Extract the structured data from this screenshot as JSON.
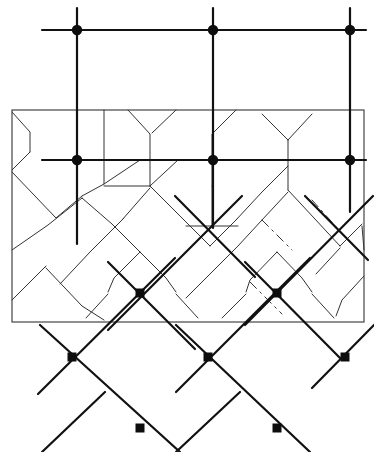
{
  "figure": {
    "background_color": "#ffffff",
    "ink_color": "#111111",
    "canvas": {
      "width": 374,
      "height": 452
    }
  },
  "frame": {
    "name": "rectangular-window",
    "x": 12,
    "y": 110,
    "width": 352,
    "height": 212,
    "stroke": "#333333",
    "stroke_width": 1.1
  },
  "orthogonal_lattice": {
    "stroke": "#111111",
    "stroke_width": 2.2,
    "marker_shape": "circle",
    "marker_radius": 5.2,
    "marker_fill": "#0d0d0d",
    "horizontal_lines": [
      {
        "y": 30,
        "x1": 42,
        "x2": 366
      },
      {
        "y": 160,
        "x1": 42,
        "x2": 366
      }
    ],
    "vertical_lines": [
      {
        "x": 77,
        "y1": 8,
        "y2": 244
      },
      {
        "x": 213,
        "y1": 8,
        "y2": 228
      },
      {
        "x": 350,
        "y1": 8,
        "y2": 212
      }
    ],
    "nodes": [
      {
        "cx": 77,
        "cy": 30
      },
      {
        "cx": 213,
        "cy": 30
      },
      {
        "cx": 350,
        "cy": 30
      },
      {
        "cx": 77,
        "cy": 160
      },
      {
        "cx": 213,
        "cy": 160
      },
      {
        "cx": 350,
        "cy": 160
      }
    ]
  },
  "diagonal_lattice": {
    "stroke": "#111111",
    "stroke_width": 2.2,
    "marker_shape": "square",
    "marker_size": 9,
    "marker_fill": "#0d0d0d",
    "down_right_lines": [
      {
        "x1": 108,
        "y1": 262,
        "x2": 195,
        "y2": 349
      },
      {
        "x1": 40,
        "y1": 325,
        "x2": 180,
        "y2": 452
      },
      {
        "x1": 245,
        "y1": 262,
        "x2": 340,
        "y2": 358
      },
      {
        "x1": 176,
        "y1": 325,
        "x2": 310,
        "y2": 452
      },
      {
        "x1": 175,
        "y1": 196,
        "x2": 255,
        "y2": 277
      },
      {
        "x1": 305,
        "y1": 196,
        "x2": 368,
        "y2": 260
      }
    ],
    "down_left_lines": [
      {
        "x1": 175,
        "y1": 258,
        "x2": 38,
        "y2": 394
      },
      {
        "x1": 242,
        "y1": 196,
        "x2": 108,
        "y2": 330
      },
      {
        "x1": 310,
        "y1": 258,
        "x2": 176,
        "y2": 392
      },
      {
        "x1": 373,
        "y1": 196,
        "x2": 245,
        "y2": 325
      },
      {
        "x1": 240,
        "y1": 392,
        "x2": 176,
        "y2": 452
      },
      {
        "x1": 105,
        "y1": 392,
        "x2": 42,
        "y2": 452
      },
      {
        "x1": 374,
        "y1": 325,
        "x2": 312,
        "y2": 388
      }
    ],
    "nodes": [
      {
        "cx": 140,
        "cy": 293
      },
      {
        "cx": 277,
        "cy": 293
      },
      {
        "cx": 72,
        "cy": 357
      },
      {
        "cx": 208,
        "cy": 357
      },
      {
        "cx": 345,
        "cy": 357
      },
      {
        "cx": 140,
        "cy": 428
      },
      {
        "cx": 277,
        "cy": 428
      }
    ]
  },
  "cell_network": {
    "stroke": "#333333",
    "stroke_width": 1.0,
    "description": "Thin polygonal cell-boundary (Voronoi) lines inside the rectangular window.",
    "paths": [
      "M 12 112 L 30 132 L 30 152",
      "M 30 152 L 12 170",
      "M 12 172 L 56 218 L 82 196",
      "M 82 196 L 104 184 L 140 160",
      "M 104 184 L 104 110",
      "M 12 250 L 48 225 L 82 198",
      "M 12 300 L 46 266",
      "M 82 198 L 112 224 L 140 252",
      "M 104 186 L 150 186",
      "M 150 186 L 178 160",
      "M 128 110 L 150 134 L 150 160",
      "M 150 160 L 150 186",
      "M 176 110 L 152 133",
      "M 150 188 L 122 220",
      "M 122 220 L 90 252",
      "M 150 186 L 180 216 L 210 246",
      "M 210 246 L 236 220",
      "M 236 220 L 262 192",
      "M 236 110 L 212 134 L 212 160",
      "M 212 160 L 212 186",
      "M 212 186 L 212 226",
      "M 212 226 L 238 226",
      "M 212 226 L 186 226",
      "M 262 192 L 288 166 L 288 140",
      "M 288 140 L 262 114",
      "M 288 140 L 312 114",
      "M 288 166 L 288 190",
      "M 288 190 L 314 218 L 340 246",
      "M 340 246 L 362 224",
      "M 288 192 L 262 220 L 238 246",
      "M 238 246 L 212 272",
      "M 212 272 L 186 298",
      "M 140 252 L 114 278 L 108 292",
      "M 140 252 L 166 278 L 176 292",
      "M 108 294 L 86 318",
      "M 176 294 L 198 318",
      "M 46 268 L 82 306 L 104 320",
      "M 90 252 L 60 284",
      "M 277 252 L 250 280 L 246 292",
      "M 277 252 L 302 278 L 312 292",
      "M 246 294 L 222 318",
      "M 312 294 L 334 318",
      "M 362 226 L 364 250",
      "M 340 248 L 316 274",
      "M 364 276 L 342 300 L 336 316"
    ],
    "dashed_paths": [
      "M 90 252 L 108 234 L 124 218",
      "M 262 220 L 280 238 L 292 250",
      "M 250 282 L 268 300 L 282 314",
      "M 312 200 L 330 220 L 344 236"
    ]
  },
  "annotations": {
    "visible_text": []
  }
}
